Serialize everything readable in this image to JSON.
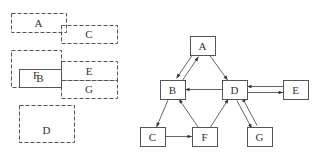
{
  "left_layout": {
    "description": "Overlapping dashed/solid rectangles (block layout)",
    "stroke_color": "#555555",
    "blocks": [
      {
        "label": "A",
        "x": 11,
        "y": 13,
        "w": 55,
        "h": 19,
        "style": "dashed"
      },
      {
        "label": "C",
        "x": 61,
        "y": 25,
        "w": 56,
        "h": 18,
        "style": "dashed"
      },
      {
        "label": "F",
        "x": 11,
        "y": 50,
        "w": 50,
        "h": 37,
        "style": "dashed"
      },
      {
        "label": "B",
        "x": 19,
        "y": 69,
        "w": 42,
        "h": 18,
        "style": "solid"
      },
      {
        "label": "E",
        "x": 61,
        "y": 61,
        "w": 56,
        "h": 19,
        "style": "dashed"
      },
      {
        "label": "G",
        "x": 61,
        "y": 80,
        "w": 56,
        "h": 18,
        "style": "dashed"
      },
      {
        "label": "D",
        "x": 19,
        "y": 105,
        "w": 55,
        "h": 37,
        "style": "dashed"
      }
    ]
  },
  "graph": {
    "description": "Directed graph of nodes A-G",
    "stroke_color": "#555555",
    "nodes": [
      {
        "id": "A",
        "x": 190,
        "y": 36,
        "w": 25,
        "h": 19
      },
      {
        "id": "B",
        "x": 160,
        "y": 80,
        "w": 25,
        "h": 19
      },
      {
        "id": "D",
        "x": 222,
        "y": 80,
        "w": 25,
        "h": 19
      },
      {
        "id": "E",
        "x": 283,
        "y": 80,
        "w": 25,
        "h": 19
      },
      {
        "id": "C",
        "x": 140,
        "y": 127,
        "w": 25,
        "h": 19
      },
      {
        "id": "F",
        "x": 192,
        "y": 127,
        "w": 25,
        "h": 19
      },
      {
        "id": "G",
        "x": 247,
        "y": 127,
        "w": 25,
        "h": 19
      }
    ],
    "edges": [
      {
        "from": "A",
        "to": "B"
      },
      {
        "from": "B",
        "to": "A"
      },
      {
        "from": "A",
        "to": "D"
      },
      {
        "from": "D",
        "to": "B"
      },
      {
        "from": "E",
        "to": "D"
      },
      {
        "from": "D",
        "to": "E"
      },
      {
        "from": "B",
        "to": "C"
      },
      {
        "from": "C",
        "to": "F"
      },
      {
        "from": "F",
        "to": "B"
      },
      {
        "from": "F",
        "to": "D"
      },
      {
        "from": "D",
        "to": "G"
      },
      {
        "from": "G",
        "to": "D"
      }
    ]
  }
}
